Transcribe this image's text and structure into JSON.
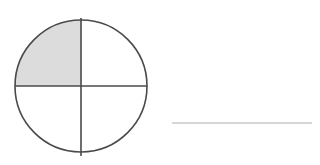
{
  "page": {
    "title": "Fraction model: circle with one quarter shaded",
    "background_color": "#ffffff",
    "width": 320,
    "height": 165
  },
  "figure": {
    "name": "quarter-shaded-circle",
    "circle": {
      "center_x": 81,
      "center_y": 86,
      "radius": 66,
      "stroke_color": "#4a4a4a",
      "stroke_width": 1.6,
      "fill_color": "#ffffff"
    },
    "divider_lines": {
      "stroke_color": "#4a4a4a",
      "stroke_width": 1.6,
      "vertical": {
        "x": 81,
        "y_start": 18,
        "y_end": 156
      },
      "horizontal": {
        "y": 86,
        "x_start": 15,
        "x_end": 147
      }
    },
    "quadrants": [
      {
        "position": "upper-left",
        "shaded": true,
        "fill_color": "#dcdcdc"
      },
      {
        "position": "upper-right",
        "shaded": false,
        "fill_color": "#ffffff"
      },
      {
        "position": "lower-left",
        "shaded": false,
        "fill_color": "#ffffff"
      },
      {
        "position": "lower-right",
        "shaded": false,
        "fill_color": "#ffffff"
      }
    ],
    "shaded_count": 1,
    "total_parts": 4
  },
  "answer_line": {
    "name": "answer-blank",
    "x_start": 172,
    "x_end": 312,
    "y": 123,
    "stroke_color": "#c8c8c8",
    "stroke_width": 1.4
  }
}
